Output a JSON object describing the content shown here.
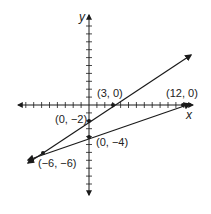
{
  "diagram": {
    "type": "coordinate-plane-two-lines",
    "axes": {
      "x_label": "x",
      "y_label": "y",
      "unit_px": 7.9,
      "origin_px": [
        89,
        105
      ]
    },
    "points": [
      {
        "id": "p1",
        "label": "(3, 0)",
        "x": 3,
        "y": 0
      },
      {
        "id": "p2",
        "label": "(12, 0)",
        "x": 12,
        "y": 0
      },
      {
        "id": "p3",
        "label": "(0, −2)",
        "x": 0,
        "y": -2
      },
      {
        "id": "p4",
        "label": "(0, −4)",
        "x": 0,
        "y": -4
      },
      {
        "id": "p5",
        "label": "(−6, −6)",
        "x": -6,
        "y": -6
      }
    ],
    "lines": [
      {
        "name": "line-through-(3,0)-and-(0,-2)",
        "passes": [
          "(-6,-6)",
          "(0,-2)",
          "(3,0)"
        ]
      },
      {
        "name": "line-through-(12,0)-and-(0,-4)",
        "passes": [
          "(-6,-6)",
          "(0,-4)",
          "(12,0)"
        ]
      }
    ],
    "line_color": "#1a1a1a"
  }
}
